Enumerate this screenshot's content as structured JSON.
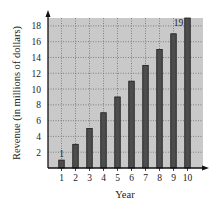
{
  "chart_data": {
    "type": "bar",
    "title": "",
    "xlabel": "Year",
    "ylabel": "Revenue (in millions of dollars)",
    "categories": [
      "1",
      "2",
      "3",
      "4",
      "5",
      "6",
      "7",
      "8",
      "9",
      "10"
    ],
    "values": [
      1,
      3,
      5,
      7,
      9,
      11,
      13,
      15,
      17,
      19
    ],
    "ylim": [
      0,
      19
    ],
    "yticks": [
      2,
      4,
      6,
      8,
      10,
      12,
      14,
      16,
      18
    ],
    "grid": true,
    "legend": null,
    "annotations": [
      {
        "category": "1",
        "text": "1"
      },
      {
        "category": "10",
        "text": "19"
      }
    ],
    "colors": {
      "plot_background": "#c9c9c9",
      "bar_fill": "#4d4d4d",
      "bar_stroke": "#1a1a1a",
      "grid": "#6e6e6e",
      "axis": "#111111"
    }
  }
}
